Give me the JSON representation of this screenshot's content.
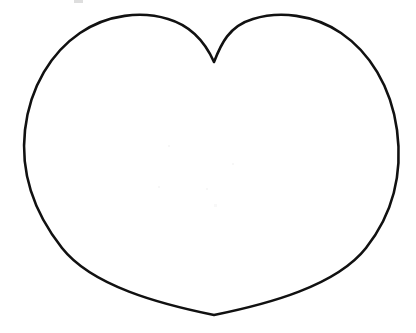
{
  "document": {
    "title": "Heart Outline Coloring Page",
    "type": "line-drawing",
    "background_color": "#ffffff",
    "width": 416,
    "height": 333
  },
  "artwork": {
    "name": "heart-outline",
    "description": "Large symmetric heart shape drawn as a single closed black outline on a plain white background, interior left unfilled.",
    "stroke_color": "#111111",
    "fill_color": "#ffffff",
    "stroke_width": 2.6,
    "symmetry_axis_x": 214,
    "path": "M 214 62 C 206 44 192 26 168 19 C 142 11 108 14 80 33 C 52 52 30 86 25 130 C 20 175 36 215 62 248 C 92 286 160 304 214 315 C 268 304 336 286 366 248 C 392 215 403 175 397 130 C 391 86 369 52 341 33 C 313 14 279 11 253 19 C 229 26 221 44 214 62 Z",
    "key_points": {
      "cleft_top": {
        "x": 214,
        "y": 62
      },
      "left_lobe_apex": {
        "x": 125,
        "y": 17
      },
      "right_lobe_apex": {
        "x": 295,
        "y": 17
      },
      "leftmost": {
        "x": 25,
        "y": 145
      },
      "rightmost": {
        "x": 397,
        "y": 145
      },
      "bottom_point": {
        "x": 214,
        "y": 315
      }
    }
  },
  "artifacts": {
    "smudge": {
      "name": "scan-smudge",
      "x": 74,
      "y": 0,
      "width": 9,
      "height": 3,
      "color": "#d8d8d8"
    },
    "speckles": [
      {
        "x": 168,
        "y": 145,
        "size": 2,
        "color": "#f7f7f7"
      },
      {
        "x": 232,
        "y": 163,
        "size": 2,
        "color": "#f7f7f7"
      },
      {
        "x": 158,
        "y": 186,
        "size": 2,
        "color": "#f7f7f7"
      },
      {
        "x": 206,
        "y": 188,
        "size": 2,
        "color": "#f7f7f7"
      },
      {
        "x": 214,
        "y": 204,
        "size": 3,
        "color": "#f8f8f8"
      }
    ]
  }
}
